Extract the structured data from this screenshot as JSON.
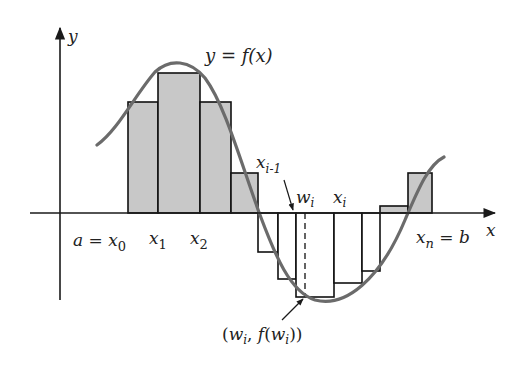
{
  "diagram": {
    "colors": {
      "axis": "#1a1a1a",
      "curve": "#6b6b6b",
      "bar_fill": "#c8c8c8",
      "bar_stroke": "#111111",
      "background": "#ffffff"
    },
    "axes": {
      "x_label": "x",
      "y_label": "y"
    },
    "curve_label": {
      "lhs": "y",
      "eq": " = ",
      "rhs": "f(x)"
    },
    "tick_labels": {
      "a_x0": {
        "a": "a",
        "eq": " = ",
        "x": "x",
        "sub": "0"
      },
      "x1": {
        "x": "x",
        "sub": "1"
      },
      "x2": {
        "x": "x",
        "sub": "2"
      },
      "xi_minus_1": {
        "x": "x",
        "sub": "i-1"
      },
      "wi": {
        "w": "w",
        "sub": "i"
      },
      "xi": {
        "x": "x",
        "sub": "i"
      },
      "xn_b": {
        "x": "x",
        "sub": "n",
        "eq": " = ",
        "b": "b"
      }
    },
    "point_label": {
      "open": "(",
      "w": "w",
      "sub": "i",
      "comma": ", ",
      "f": "f",
      "open2": "(",
      "w2": "w",
      "sub2": "i",
      "close": "))"
    },
    "bars": [
      {
        "x0": 128,
        "x1": 158,
        "height_px": 111,
        "shaded": true
      },
      {
        "x0": 158,
        "x1": 200,
        "height_px": 140,
        "shaded": true
      },
      {
        "x0": 200,
        "x1": 231,
        "height_px": 111,
        "shaded": true
      },
      {
        "x0": 231,
        "x1": 258,
        "height_px": 40,
        "shaded": true
      },
      {
        "x0": 258,
        "x1": 278,
        "height_px": -39,
        "shaded": false
      },
      {
        "x0": 278,
        "x1": 296,
        "height_px": -66,
        "shaded": false
      },
      {
        "x0": 296,
        "x1": 334,
        "height_px": -84,
        "shaded": false
      },
      {
        "x0": 334,
        "x1": 362,
        "height_px": -70,
        "shaded": false
      },
      {
        "x0": 362,
        "x1": 380,
        "height_px": -58,
        "shaded": false
      },
      {
        "x0": 380,
        "x1": 408,
        "height_px": 7,
        "shaded": true
      },
      {
        "x0": 408,
        "x1": 432,
        "height_px": 40,
        "shaded": true
      }
    ]
  }
}
